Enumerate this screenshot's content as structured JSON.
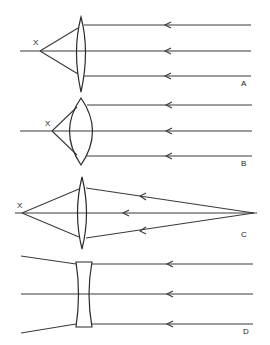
{
  "figure": {
    "panels": [
      {
        "id": "A",
        "label": "A",
        "focal_label": "X",
        "lens_type": "biconvex-thin",
        "rays": "parallel-converging"
      },
      {
        "id": "B",
        "label": "B",
        "focal_label": "X",
        "lens_type": "biconvex-thick",
        "rays": "parallel-converging"
      },
      {
        "id": "C",
        "label": "C",
        "focal_label": "X",
        "lens_type": "biconvex-thin",
        "rays": "point-source-converging"
      },
      {
        "id": "D",
        "label": "D",
        "lens_type": "biconcave",
        "rays": "parallel-diverging"
      }
    ]
  },
  "colors": {
    "line": "#2a2a2a",
    "background": "#ffffff"
  }
}
